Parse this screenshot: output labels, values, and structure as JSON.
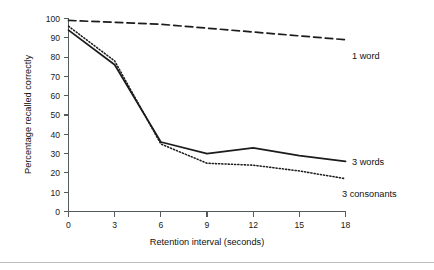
{
  "chart_data": {
    "type": "line",
    "title": "",
    "xlabel": "Retention interval (seconds)",
    "ylabel": "Percentage recalled correctly",
    "x": [
      0,
      3,
      6,
      9,
      12,
      15,
      18
    ],
    "xlim": [
      0,
      18
    ],
    "ylim": [
      0,
      100
    ],
    "xticks": [
      "0",
      "3",
      "6",
      "9",
      "12",
      "15",
      "18"
    ],
    "yticks": [
      "0",
      "10",
      "20",
      "30",
      "40",
      "50",
      "60",
      "70",
      "80",
      "90",
      "100"
    ],
    "grid": false,
    "legend_position": "right-inline",
    "series": [
      {
        "name": "1 word",
        "style": "dashed",
        "color": "#1c1c1c",
        "values": [
          99,
          98,
          97,
          95,
          93,
          91,
          89
        ]
      },
      {
        "name": "3 words",
        "style": "solid",
        "color": "#1c1c1c",
        "values": [
          94,
          76,
          36,
          30,
          33,
          29,
          26
        ]
      },
      {
        "name": "3 consonants",
        "style": "dotted",
        "color": "#1c1c1c",
        "values": [
          96,
          78,
          35,
          25,
          24,
          21,
          17
        ]
      }
    ]
  },
  "axis": {
    "y_title": "Percentage recalled correctly",
    "x_title": "Retention interval (seconds)"
  },
  "labels": {
    "one_word": "1 word",
    "three_words": "3 words",
    "three_consonants": "3 consonants"
  },
  "ticks": {
    "y": [
      "100",
      "90",
      "80",
      "70",
      "60",
      "50",
      "40",
      "30",
      "20",
      "10",
      "0"
    ],
    "x": [
      "0",
      "3",
      "6",
      "9",
      "12",
      "15",
      "18"
    ]
  },
  "colors": {
    "ink": "#1c1c1c",
    "axis": "#555c5e",
    "rule": "#b9bdbe",
    "background": "#ffffff"
  }
}
